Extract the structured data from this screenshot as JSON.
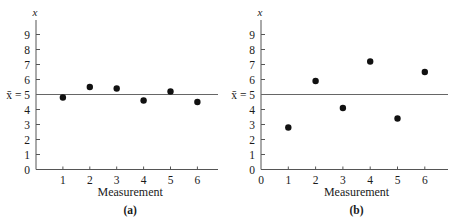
{
  "chart_data": [
    {
      "type": "scatter",
      "panel_label": "(a)",
      "title": "",
      "xlabel": "Measurement",
      "ylabel": "x",
      "mean_label": "x̄ = 5",
      "mean_value": 5,
      "x": [
        1,
        2,
        3,
        4,
        5,
        6
      ],
      "values": [
        4.8,
        5.5,
        5.4,
        4.6,
        5.2,
        4.5
      ],
      "x_ticks": [
        "1",
        "2",
        "3",
        "4",
        "5",
        "6"
      ],
      "y_ticks": [
        "0",
        "1",
        "2",
        "3",
        "4",
        "6",
        "7",
        "8",
        "9"
      ],
      "show_x_zero_label": false,
      "ylim": [
        0,
        10
      ],
      "xlim": [
        0,
        6.8
      ],
      "grid": false,
      "legend": null
    },
    {
      "type": "scatter",
      "panel_label": "(b)",
      "title": "",
      "xlabel": "Measurement",
      "ylabel": "x",
      "mean_label": "x̄ = 5",
      "mean_value": 5,
      "x": [
        1,
        2,
        3,
        4,
        5,
        6
      ],
      "values": [
        2.8,
        5.9,
        4.1,
        7.2,
        3.4,
        6.5
      ],
      "x_ticks": [
        "0",
        "1",
        "2",
        "3",
        "4",
        "5",
        "6"
      ],
      "y_ticks": [
        "0",
        "1",
        "2",
        "3",
        "4",
        "6",
        "7",
        "8",
        "9"
      ],
      "show_x_zero_label": true,
      "ylim": [
        0,
        10
      ],
      "xlim": [
        0,
        6.8
      ],
      "grid": false,
      "legend": null
    }
  ],
  "colors": {
    "axis": "#555555",
    "mean_line": "#666666",
    "point": "#111111",
    "text": "#1a1a1a"
  }
}
